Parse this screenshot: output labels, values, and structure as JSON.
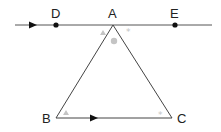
{
  "diagram": {
    "type": "geometry",
    "colors": {
      "line": "#3a3a3a",
      "marker": "#bdbdbd",
      "point": "#111111"
    },
    "points": {
      "D": {
        "label": "D",
        "x": 56,
        "y": 25
      },
      "A": {
        "label": "A",
        "x": 113,
        "y": 25
      },
      "E": {
        "label": "E",
        "x": 175,
        "y": 25
      },
      "B": {
        "label": "B",
        "x": 56,
        "y": 118
      },
      "C": {
        "label": "C",
        "x": 172,
        "y": 118
      }
    },
    "segments": [
      {
        "name": "line-DE",
        "from": [
          15,
          25
        ],
        "to": [
          212,
          25
        ],
        "parallel_mark": true
      },
      {
        "name": "side-AB",
        "from": "A",
        "to": "B"
      },
      {
        "name": "side-AC",
        "from": "A",
        "to": "C"
      },
      {
        "name": "side-BC",
        "from": "B",
        "to": "C",
        "parallel_mark": true
      }
    ],
    "angle_markers": [
      {
        "at": "A",
        "side": "left",
        "symbol": "triangle"
      },
      {
        "at": "A",
        "side": "middle",
        "symbol": "circle"
      },
      {
        "at": "A",
        "side": "right",
        "symbol": "asterisk"
      },
      {
        "at": "B",
        "symbol": "triangle"
      },
      {
        "at": "C",
        "symbol": "asterisk"
      }
    ]
  }
}
